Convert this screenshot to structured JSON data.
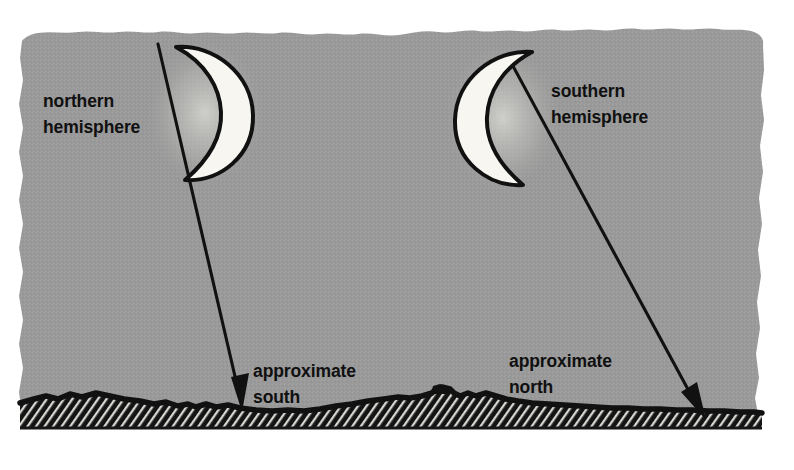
{
  "figure": {
    "background_color": "#ffffff",
    "sky_color": "#9a9a9a",
    "ground_color": "#1a1a1a",
    "moon_fill_color": "#f7f6f1",
    "ink_color": "#101010"
  },
  "labels": {
    "northern": {
      "line1": "northern",
      "line2": "hemisphere"
    },
    "southern": {
      "line1": "southern",
      "line2": "hemisphere"
    },
    "approximate_south": {
      "line1": "approximate",
      "line2": "south"
    },
    "approximate_north": {
      "line1": "approximate",
      "line2": "north"
    }
  },
  "moons": [
    {
      "name": "northern-hemisphere-moon",
      "phase": "waxing crescent",
      "crescent_opens": "left",
      "lit_limb": "right"
    },
    {
      "name": "southern-hemisphere-moon",
      "phase": "waxing crescent",
      "crescent_opens": "right",
      "lit_limb": "left"
    }
  ],
  "arrows": [
    {
      "name": "north-hemisphere-direction-arrow",
      "points_to": "approximate south",
      "direction": "down-right"
    },
    {
      "name": "south-hemisphere-direction-arrow",
      "points_to": "approximate north",
      "direction": "down-right"
    }
  ]
}
